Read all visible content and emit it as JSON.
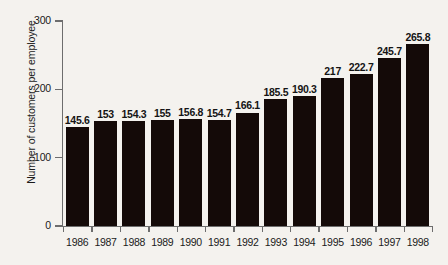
{
  "chart_data": {
    "type": "bar",
    "title": "",
    "xlabel": "",
    "ylabel": "Number of customers per employee",
    "categories": [
      "1986",
      "1987",
      "1988",
      "1989",
      "1990",
      "1991",
      "1992",
      "1993",
      "1994",
      "1995",
      "1996",
      "1997",
      "1998"
    ],
    "values": [
      145.6,
      153,
      154.3,
      155,
      156.8,
      154.7,
      166.1,
      185.5,
      190.3,
      217,
      222.7,
      245.7,
      265.8
    ],
    "value_labels": [
      "145.6",
      "153",
      "154.3",
      "155",
      "156.8",
      "154.7",
      "166.1",
      "185.5",
      "190.3",
      "217",
      "222.7",
      "245.7",
      "265.8"
    ],
    "ylim": [
      0,
      300
    ],
    "y_ticks": [
      0,
      100,
      200,
      300
    ],
    "y_tick_labels": [
      "0",
      "100",
      "200",
      "300"
    ],
    "grid": false,
    "legend": null,
    "bar_color": "#140a08",
    "background_color": "#f4f2ee",
    "axis_color": "#6d6d6d",
    "text_color": "#1a1a1a"
  }
}
